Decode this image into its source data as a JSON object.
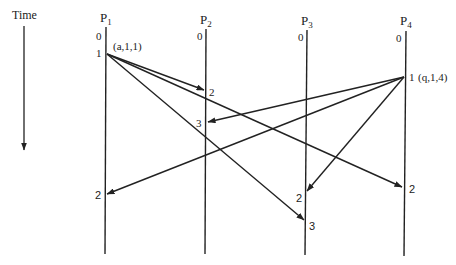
{
  "time_axis": {
    "label": "Time"
  },
  "processes": [
    {
      "id": "P1",
      "name": "P",
      "sub": "1",
      "x": 106,
      "events": [
        {
          "label": "0",
          "y": 38,
          "side": "left"
        },
        {
          "label": "1",
          "y": 53,
          "side": "left"
        },
        {
          "label": "2",
          "y": 195,
          "side": "left"
        }
      ]
    },
    {
      "id": "P2",
      "name": "P",
      "sub": "2",
      "x": 206,
      "events": [
        {
          "label": "0",
          "y": 38,
          "side": "left"
        },
        {
          "label": "2",
          "y": 92,
          "side": "right"
        },
        {
          "label": "3",
          "y": 122,
          "side": "left"
        }
      ]
    },
    {
      "id": "P3",
      "name": "P",
      "sub": "3",
      "x": 306,
      "events": [
        {
          "label": "0",
          "y": 38,
          "side": "left"
        },
        {
          "label": "2",
          "y": 192,
          "side": "left"
        },
        {
          "label": "3",
          "y": 222,
          "side": "right"
        }
      ]
    },
    {
      "id": "P4",
      "name": "P",
      "sub": "4",
      "x": 404,
      "events": [
        {
          "label": "0",
          "y": 38,
          "side": "left"
        },
        {
          "label": "1",
          "y": 77,
          "side": "right"
        },
        {
          "label": "2",
          "y": 187,
          "side": "right"
        }
      ]
    }
  ],
  "annotations": {
    "p1_message": "(a,1,1)",
    "p4_message": "(q,1,4)"
  },
  "messages": [
    {
      "from": "P1",
      "x1": 106,
      "y1": 53,
      "to": "P2",
      "x2": 206,
      "y2": 91
    },
    {
      "from": "P1",
      "x1": 106,
      "y1": 53,
      "to": "P3",
      "x2": 306,
      "y2": 221
    },
    {
      "from": "P1",
      "x1": 106,
      "y1": 53,
      "to": "P4",
      "x2": 404,
      "y2": 187
    },
    {
      "from": "P4",
      "x1": 404,
      "y1": 77,
      "to": "P2",
      "x2": 206,
      "y2": 122
    },
    {
      "from": "P4",
      "x1": 404,
      "y1": 77,
      "to": "P1",
      "x2": 106,
      "y2": 195
    },
    {
      "from": "P4",
      "x1": 404,
      "y1": 77,
      "to": "P3",
      "x2": 306,
      "y2": 192
    }
  ]
}
